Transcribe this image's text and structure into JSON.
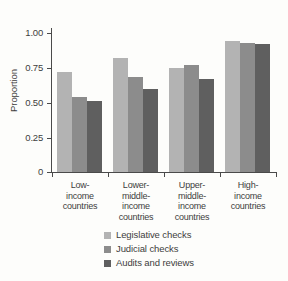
{
  "chart_data": {
    "type": "bar",
    "title": "",
    "subtitle": "",
    "xlabel": "",
    "ylabel": "Proportion",
    "ylim": [
      0,
      1.0
    ],
    "grid": false,
    "legend_position": "bottom",
    "categories": [
      "Low-\nincome\ncountries",
      "Lower-\nmiddle-\nincome\ncountries",
      "Upper-\nmiddle-\nincome\ncountries",
      "High-\nincome\ncountries"
    ],
    "series": [
      {
        "name": "Legislative checks",
        "color": "#b3b3b3",
        "values": [
          0.72,
          0.82,
          0.75,
          0.94
        ]
      },
      {
        "name": "Judicial checks",
        "color": "#8c8c8c",
        "values": [
          0.54,
          0.68,
          0.77,
          0.93
        ]
      },
      {
        "name": "Audits and reviews",
        "color": "#5f5f5f",
        "values": [
          0.51,
          0.6,
          0.67,
          0.92
        ]
      }
    ],
    "yticks": [
      {
        "value": 1.0,
        "label": "1.00"
      },
      {
        "value": 0.75,
        "label": "0.75"
      },
      {
        "value": 0.5,
        "label": "0.50"
      },
      {
        "value": 0.25,
        "label": "0.25"
      },
      {
        "value": 0.0,
        "label": "0"
      }
    ]
  },
  "axis": {
    "y_title": "Proportion",
    "tick_1_00": "1.00",
    "tick_0_75": "0.75",
    "tick_0_50": "0.50",
    "tick_0_25": "0.25",
    "tick_0": "0"
  },
  "categories": {
    "c0_line0": "Low-",
    "c0_line1": "income",
    "c0_line2": "countries",
    "c1_line0": "Lower-",
    "c1_line1": "middle-",
    "c1_line2": "income",
    "c1_line3": "countries",
    "c2_line0": "Upper-",
    "c2_line1": "middle-",
    "c2_line2": "income",
    "c2_line3": "countries",
    "c3_line0": "High-",
    "c3_line1": "income",
    "c3_line2": "countries"
  },
  "legend": {
    "item0": "Legislative checks",
    "item1": "Judicial checks",
    "item2": "Audits and reviews"
  }
}
